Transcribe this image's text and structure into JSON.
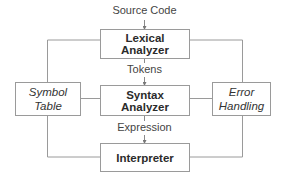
{
  "diagram": {
    "type": "flowchart",
    "input_label": "Source Code",
    "nodes": {
      "lexical_analyzer": "Lexical Analyzer",
      "syntax_analyzer": "Syntax Analyzer",
      "interpreter": "Interpreter",
      "symbol_table_line1": "Symbol",
      "symbol_table_line2": "Table",
      "error_handling_line1": "Error",
      "error_handling_line2": "Handling"
    },
    "edges": {
      "lexical_to_syntax": "Tokens",
      "syntax_to_interpreter": "Expression"
    },
    "colors": {
      "border": "#9a9a9a",
      "text": "#333333",
      "background": "#ffffff"
    }
  }
}
